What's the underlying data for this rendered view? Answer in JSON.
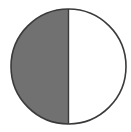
{
  "diagram": {
    "type": "half-shaded-circle",
    "fraction_shaded": "1/2",
    "shaded_side": "left",
    "colors": {
      "shaded_fill": "#717171",
      "unshaded_fill": "#ffffff",
      "stroke": "#3a3a3a",
      "background": "#ffffff"
    },
    "geometry": {
      "cx": 68.5,
      "cy": 66.5,
      "r": 57.5
    }
  }
}
